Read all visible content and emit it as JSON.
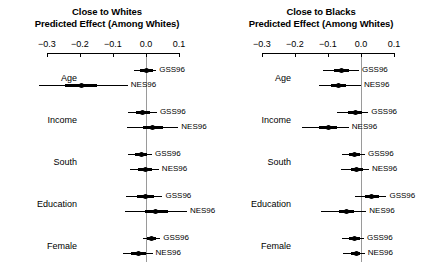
{
  "figure": {
    "width": 428,
    "height": 268,
    "background": "#ffffff",
    "ink_color": "#000000",
    "zero_line_color": "#9a9a9a"
  },
  "chart_data": {
    "type": "scatter",
    "subtype": "coefficient-forest-plot",
    "title": "",
    "xlabel": "Predicted Effect (Among Whites)",
    "ylabel": "",
    "xlim": [
      -0.35,
      0.13
    ],
    "grid": false,
    "legend_position": "inline-right-of-each-interval",
    "legend_entries": [
      "GSS96",
      "NES96"
    ],
    "xticks": [
      -0.3,
      -0.2,
      -0.1,
      0.0,
      0.1
    ],
    "xticklabels": [
      "−0.3",
      "−0.2",
      "−0.1",
      "0.0",
      "0.1"
    ],
    "reference_line": 0.0,
    "categories": [
      "Age",
      "Income",
      "South",
      "Education",
      "Female"
    ],
    "panels": [
      {
        "id": "close-to-whites",
        "title_line1": "Close to Whites",
        "title_line2": "Predicted Effect (Among Whites)",
        "rows": [
          {
            "category": "Age",
            "series": "GSS96",
            "estimate": 0.003,
            "ci_low": -0.037,
            "ci_high": 0.031,
            "ci_inner_low": -0.018,
            "ci_inner_high": 0.021
          },
          {
            "category": "Age",
            "series": "NES96",
            "estimate": -0.196,
            "ci_low": -0.325,
            "ci_high": -0.055,
            "ci_inner_low": -0.245,
            "ci_inner_high": -0.147
          },
          {
            "category": "Income",
            "series": "GSS96",
            "estimate": -0.01,
            "ci_low": -0.055,
            "ci_high": 0.033,
            "ci_inner_low": -0.031,
            "ci_inner_high": 0.013
          },
          {
            "category": "Income",
            "series": "NES96",
            "estimate": 0.02,
            "ci_low": -0.057,
            "ci_high": 0.098,
            "ci_inner_low": -0.01,
            "ci_inner_high": 0.052
          },
          {
            "category": "South",
            "series": "GSS96",
            "estimate": -0.015,
            "ci_low": -0.055,
            "ci_high": 0.018,
            "ci_inner_low": -0.034,
            "ci_inner_high": 0.003
          },
          {
            "category": "South",
            "series": "NES96",
            "estimate": -0.003,
            "ci_low": -0.049,
            "ci_high": 0.039,
            "ci_inner_low": -0.024,
            "ci_inner_high": 0.018
          },
          {
            "category": "Education",
            "series": "GSS96",
            "estimate": -0.002,
            "ci_low": -0.061,
            "ci_high": 0.05,
            "ci_inner_low": -0.028,
            "ci_inner_high": 0.024
          },
          {
            "category": "Education",
            "series": "NES96",
            "estimate": 0.03,
            "ci_low": -0.063,
            "ci_high": 0.124,
            "ci_inner_low": -0.004,
            "ci_inner_high": 0.066
          },
          {
            "category": "Female",
            "series": "GSS96",
            "estimate": 0.016,
            "ci_low": -0.008,
            "ci_high": 0.043,
            "ci_inner_low": 0.004,
            "ci_inner_high": 0.029
          },
          {
            "category": "Female",
            "series": "NES96",
            "estimate": -0.022,
            "ci_low": -0.07,
            "ci_high": 0.02,
            "ci_inner_low": -0.044,
            "ci_inner_high": -0.001
          }
        ]
      },
      {
        "id": "close-to-blacks",
        "title_line1": "Close to Blacks",
        "title_line2": "Predicted Effect (Among Whites)",
        "rows": [
          {
            "category": "Age",
            "series": "GSS96",
            "estimate": -0.058,
            "ci_low": -0.115,
            "ci_high": -0.006,
            "ci_inner_low": -0.082,
            "ci_inner_high": -0.035
          },
          {
            "category": "Age",
            "series": "NES96",
            "estimate": -0.067,
            "ci_low": -0.128,
            "ci_high": 0.0,
            "ci_inner_low": -0.09,
            "ci_inner_high": -0.044
          },
          {
            "category": "Income",
            "series": "GSS96",
            "estimate": -0.017,
            "ci_low": -0.072,
            "ci_high": 0.022,
            "ci_inner_low": -0.038,
            "ci_inner_high": 0.002
          },
          {
            "category": "Income",
            "series": "NES96",
            "estimate": -0.1,
            "ci_low": -0.178,
            "ci_high": -0.037,
            "ci_inner_low": -0.126,
            "ci_inner_high": -0.074
          },
          {
            "category": "South",
            "series": "GSS96",
            "estimate": -0.02,
            "ci_low": -0.059,
            "ci_high": 0.012,
            "ci_inner_low": -0.036,
            "ci_inner_high": -0.004
          },
          {
            "category": "South",
            "series": "NES96",
            "estimate": -0.013,
            "ci_low": -0.062,
            "ci_high": 0.024,
            "ci_inner_low": -0.031,
            "ci_inner_high": 0.005
          },
          {
            "category": "Education",
            "series": "GSS96",
            "estimate": 0.033,
            "ci_low": -0.018,
            "ci_high": 0.077,
            "ci_inner_low": 0.012,
            "ci_inner_high": 0.054
          },
          {
            "category": "Education",
            "series": "NES96",
            "estimate": -0.044,
            "ci_low": -0.12,
            "ci_high": 0.016,
            "ci_inner_low": -0.068,
            "ci_inner_high": -0.021
          },
          {
            "category": "Female",
            "series": "GSS96",
            "estimate": -0.019,
            "ci_low": -0.059,
            "ci_high": 0.009,
            "ci_inner_low": -0.035,
            "ci_inner_high": -0.004
          },
          {
            "category": "Female",
            "series": "NES96",
            "estimate": -0.015,
            "ci_low": -0.054,
            "ci_high": 0.011,
            "ci_inner_low": -0.03,
            "ci_inner_high": -0.002
          }
        ]
      }
    ]
  }
}
